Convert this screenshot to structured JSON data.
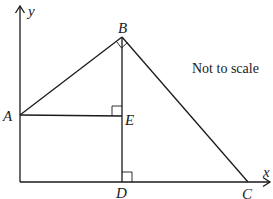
{
  "diagram": {
    "note": "Not to scale",
    "axes": {
      "x_label": "x",
      "y_label": "y"
    },
    "points": {
      "A": {
        "label": "A"
      },
      "B": {
        "label": "B"
      },
      "C": {
        "label": "C"
      },
      "D": {
        "label": "D"
      },
      "E": {
        "label": "E"
      }
    },
    "segments": [
      "AB",
      "BC",
      "BD",
      "AE",
      "DC"
    ],
    "right_angles": [
      "ABC",
      "AEB",
      "BDC"
    ],
    "colors": {
      "stroke": "#1a1a1a",
      "background": "#ffffff"
    }
  }
}
